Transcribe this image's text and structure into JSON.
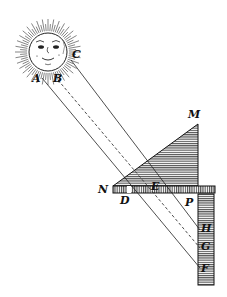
{
  "diagram": {
    "labels": {
      "A": "A",
      "B": "B",
      "C": "C",
      "M": "M",
      "N": "N",
      "D": "D",
      "E": "E",
      "P": "P",
      "H": "H",
      "G": "G",
      "F": "F"
    },
    "elements": {
      "sun": "sun with face and rays",
      "prism": "hatched right triangle N-M with apex M",
      "horizontal_board": "hatched horizontal bar N to P",
      "screen": "hatched vertical bar with points H, G, F",
      "rays": [
        "A to F",
        "B to G (dashed)",
        "C to H"
      ]
    },
    "colors": {
      "ink": "#111111",
      "background": "#ffffff"
    }
  }
}
